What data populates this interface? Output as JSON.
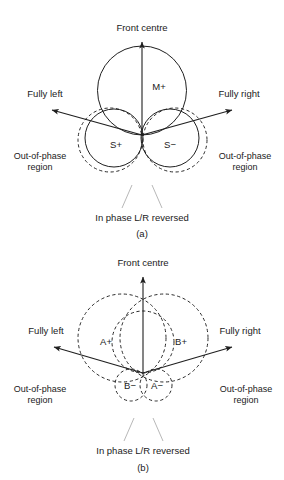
{
  "figure": {
    "panels": [
      {
        "id": "a",
        "caption": "(a)",
        "front_label": "Front centre",
        "left_label": "Fully left",
        "right_label": "Fully right",
        "out_of_phase_left_line1": "Out-of-phase",
        "out_of_phase_left_line2": "region",
        "out_of_phase_right_line1": "Out-of-phase",
        "out_of_phase_right_line2": "region",
        "bottom_label": "In phase L/R reversed",
        "lobes": [
          {
            "name": "mid-plus",
            "label": "M+"
          },
          {
            "name": "side-plus",
            "label": "S+"
          },
          {
            "name": "side-minus",
            "label": "S−"
          }
        ]
      },
      {
        "id": "b",
        "caption": "(b)",
        "front_label": "Front centre",
        "left_label": "Fully left",
        "right_label": "Fully right",
        "out_of_phase_left_line1": "Out-of-phase",
        "out_of_phase_left_line2": "region",
        "out_of_phase_right_line1": "Out-of-phase",
        "out_of_phase_right_line2": "region",
        "bottom_label": "In phase L/R reversed",
        "lobes": [
          {
            "name": "a-plus",
            "label": "A+"
          },
          {
            "name": "b-plus",
            "label": "B+"
          },
          {
            "name": "b-minus",
            "label": "B−"
          },
          {
            "name": "a-minus",
            "label": "A−"
          }
        ]
      }
    ],
    "colors": {
      "stroke_solid": "#1f1f1f",
      "stroke_dashed": "#2a2a2a",
      "leader": "#b8b8b8",
      "text": "#1a1a1a",
      "background": "#ffffff"
    }
  }
}
